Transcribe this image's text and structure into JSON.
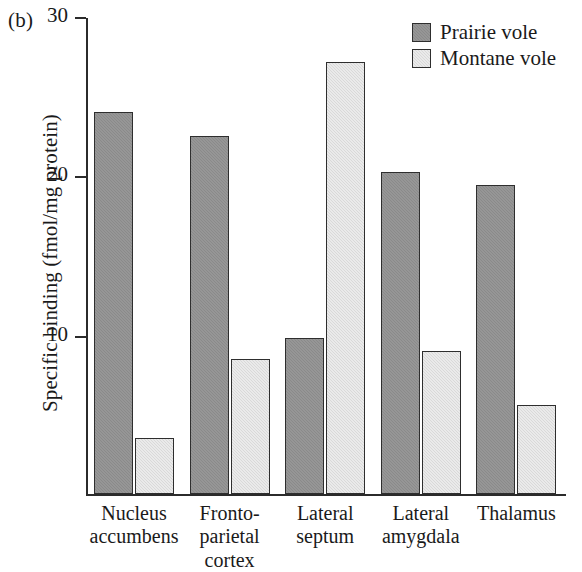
{
  "panel": {
    "label": "(b)"
  },
  "chart_data": {
    "type": "bar",
    "title": "",
    "panel_label": "(b)",
    "xlabel": "",
    "ylabel": "Specific binding (fmol/mg protein)",
    "ylim": [
      0,
      30
    ],
    "yticks": [
      10,
      20,
      30
    ],
    "ytick_labels": [
      "10",
      "20",
      "30"
    ],
    "grid": false,
    "legend_position": "top-right",
    "categories": [
      "Nucleus accumbens",
      "Fronto-parietal cortex",
      "Lateral septum",
      "Lateral amygdala",
      "Thalamus"
    ],
    "category_lines": [
      [
        "Nucleus",
        "accumbens"
      ],
      [
        "Fronto-",
        "parietal",
        "cortex"
      ],
      [
        "Lateral",
        "septum"
      ],
      [
        "Lateral",
        "amygdala"
      ],
      [
        "Thalamus"
      ]
    ],
    "series": [
      {
        "name": "Prairie vole",
        "color": "#8a8a8a",
        "values": [
          24.0,
          22.5,
          9.8,
          20.2,
          19.4
        ]
      },
      {
        "name": "Montane vole",
        "color": "#d9d9d9",
        "values": [
          3.5,
          8.5,
          27.1,
          9.0,
          5.6
        ]
      }
    ]
  },
  "legend": {
    "items": [
      {
        "label": "Prairie vole"
      },
      {
        "label": "Montane vole"
      }
    ]
  }
}
